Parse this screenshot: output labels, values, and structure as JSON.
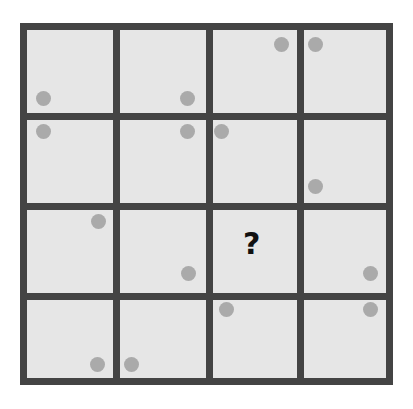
{
  "puzzle": {
    "rows": 4,
    "cols": 4,
    "colors": {
      "line": "#444444",
      "cell": "#e6e6e6",
      "dot": "#aaaaaa",
      "question": "#111111"
    },
    "question_mark": "?",
    "missing_cell": {
      "row": 2,
      "col": 2
    },
    "cells": [
      {
        "row": 0,
        "col": 0,
        "dot": "bottom-left"
      },
      {
        "row": 0,
        "col": 1,
        "dot": "bottom-right"
      },
      {
        "row": 0,
        "col": 2,
        "dot": "top-right"
      },
      {
        "row": 0,
        "col": 3,
        "dot": "top-left"
      },
      {
        "row": 1,
        "col": 0,
        "dot": "top-left"
      },
      {
        "row": 1,
        "col": 1,
        "dot": "top-right"
      },
      {
        "row": 1,
        "col": 2,
        "dot": "top-left"
      },
      {
        "row": 1,
        "col": 3,
        "dot": "bottom-left"
      },
      {
        "row": 2,
        "col": 0,
        "dot": "top-right"
      },
      {
        "row": 2,
        "col": 1,
        "dot": "bottom-right"
      },
      {
        "row": 2,
        "col": 2,
        "dot": null
      },
      {
        "row": 2,
        "col": 3,
        "dot": "bottom-right"
      },
      {
        "row": 3,
        "col": 0,
        "dot": "bottom-right"
      },
      {
        "row": 3,
        "col": 1,
        "dot": "bottom-left"
      },
      {
        "row": 3,
        "col": 2,
        "dot": "top-left"
      },
      {
        "row": 3,
        "col": 3,
        "dot": "top-right"
      }
    ]
  }
}
